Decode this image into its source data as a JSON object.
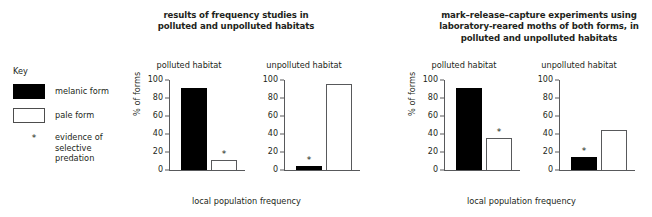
{
  "figure": {
    "sections": [
      {
        "title": "results of frequency studies in\npolluted and unpolluted habitats",
        "title_line1": "results of frequency studies in",
        "title_line2": "polluted and unpolluted habitats",
        "xlabel": "local population frequency"
      },
      {
        "title": "mark–release–capture experiments using laboratory-reared moths of both forms, in polluted and unpolluted habitats",
        "title_line1": "mark–release–capture experiments using",
        "title_line2": "laboratory-reared moths of both forms, in",
        "title_line3": "polluted and unpolluted habitats",
        "xlabel": "local population frequency"
      }
    ]
  },
  "key": {
    "heading": "Key",
    "items": [
      {
        "swatch": "black-square",
        "label": "melanic form"
      },
      {
        "swatch": "white-square",
        "label": "pale form"
      },
      {
        "swatch": "asterisk",
        "label_line1": "evidence of",
        "label_line2": "selective",
        "label_line3": "predation",
        "label": "evidence of selective predation"
      }
    ]
  },
  "colors": {
    "melanic": "#000000",
    "pale": "#ffffff",
    "outline": "#58595b",
    "text": "#231f20"
  },
  "chart_data": [
    {
      "type": "bar",
      "title": "polluted habitat",
      "section": "results of frequency studies in polluted and unpolluted habitats",
      "categories": [
        "melanic form",
        "pale form"
      ],
      "values": [
        91,
        11
      ],
      "annotations": [
        {
          "category": "pale form",
          "marker": "*",
          "meaning": "evidence of selective predation"
        }
      ],
      "xlabel": "local population frequency",
      "ylabel": "% of forms",
      "ylim": [
        0,
        100
      ],
      "yticks": [
        0,
        20,
        40,
        60,
        80,
        100
      ],
      "grid": false,
      "legend": "external-key"
    },
    {
      "type": "bar",
      "title": "unpolluted habitat",
      "section": "results of frequency studies in polluted and unpolluted habitats",
      "categories": [
        "melanic form",
        "pale form"
      ],
      "values": [
        4,
        96
      ],
      "annotations": [
        {
          "category": "melanic form",
          "marker": "*",
          "meaning": "evidence of selective predation"
        }
      ],
      "xlabel": "local population frequency",
      "ylabel": "",
      "ylim": [
        0,
        100
      ],
      "yticks": [
        0,
        20,
        40,
        60,
        80,
        100
      ],
      "grid": false,
      "legend": "external-key"
    },
    {
      "type": "bar",
      "title": "polluted habitat",
      "section": "mark-release-capture experiments using laboratory-reared moths of both forms, in polluted and unpolluted habitats",
      "categories": [
        "melanic form",
        "pale form"
      ],
      "values": [
        91,
        36
      ],
      "annotations": [
        {
          "category": "pale form",
          "marker": "*",
          "meaning": "evidence of selective predation"
        }
      ],
      "xlabel": "local population frequency",
      "ylabel": "% of forms",
      "ylim": [
        0,
        100
      ],
      "yticks": [
        0,
        20,
        40,
        60,
        80,
        100
      ],
      "grid": false,
      "legend": "external-key"
    },
    {
      "type": "bar",
      "title": "unpolluted habitat",
      "section": "mark-release-capture experiments using laboratory-reared moths of both forms, in polluted and unpolluted habitats",
      "categories": [
        "melanic form",
        "pale form"
      ],
      "values": [
        14,
        45
      ],
      "annotations": [
        {
          "category": "melanic form",
          "marker": "*",
          "meaning": "evidence of selective predation"
        }
      ],
      "xlabel": "local population frequency",
      "ylabel": "",
      "ylim": [
        0,
        100
      ],
      "yticks": [
        0,
        20,
        40,
        60,
        80,
        100
      ],
      "grid": false,
      "legend": "external-key"
    }
  ]
}
